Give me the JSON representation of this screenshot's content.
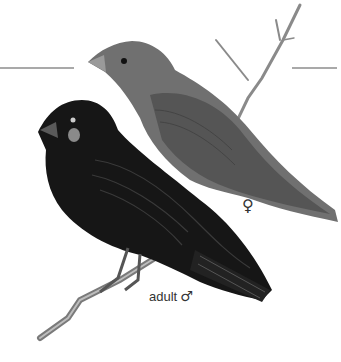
{
  "illustration": {
    "subject": "two finches perched on a twig",
    "birds": [
      {
        "id": "female",
        "label": "♀",
        "tone": "#6e6e6e"
      },
      {
        "id": "adult-male",
        "label_text": "adult",
        "label_symbol": "♂",
        "tone": "#1a1a1a"
      }
    ],
    "colors": {
      "background": "#ffffff",
      "female_body": "#707070",
      "female_wing": "#5a5a5a",
      "male_body": "#161616",
      "male_wing": "#2b2b2b",
      "branch": "#8a8a8a",
      "rule_lines": "#555555",
      "label_text": "#333333"
    }
  }
}
